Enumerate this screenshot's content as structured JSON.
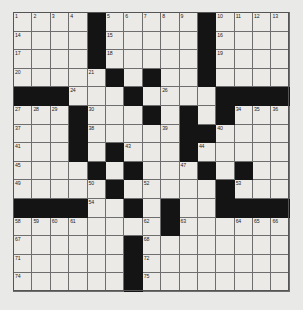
{
  "puzzle": {
    "kind": "crossword-grid",
    "rows": 15,
    "cols": 15,
    "colors": {
      "background": "#e9e9e7",
      "cell_fill": "#eceae6",
      "block_fill": "#141414",
      "grid_line": "#6e6e6e",
      "number_color": "#1d1d1d"
    },
    "layout": [
      "....#.....#....",
      "....#.....#....",
      "....#.....#....",
      ".....#.#..#....",
      "###...#....####",
      "...#...#.#.#...",
      "...#.....##....",
      "...#.#...#.....",
      "....#.#...#.#..",
      ".....#.....#...",
      "####..#.#..####",
      "........#......",
      "......#........",
      "......#........",
      "......#........"
    ],
    "numbers": [
      {
        "r": 0,
        "c": 0,
        "n": "1"
      },
      {
        "r": 0,
        "c": 1,
        "n": "2"
      },
      {
        "r": 0,
        "c": 2,
        "n": "3"
      },
      {
        "r": 0,
        "c": 3,
        "n": "4"
      },
      {
        "r": 0,
        "c": 5,
        "n": "5"
      },
      {
        "r": 0,
        "c": 6,
        "n": "6"
      },
      {
        "r": 0,
        "c": 7,
        "n": "7"
      },
      {
        "r": 0,
        "c": 8,
        "n": "8"
      },
      {
        "r": 0,
        "c": 9,
        "n": "9"
      },
      {
        "r": 0,
        "c": 11,
        "n": "10"
      },
      {
        "r": 0,
        "c": 12,
        "n": "11"
      },
      {
        "r": 0,
        "c": 13,
        "n": "12"
      },
      {
        "r": 0,
        "c": 14,
        "n": "13"
      },
      {
        "r": 1,
        "c": 0,
        "n": "14"
      },
      {
        "r": 1,
        "c": 5,
        "n": "15"
      },
      {
        "r": 1,
        "c": 11,
        "n": "16"
      },
      {
        "r": 2,
        "c": 0,
        "n": "17"
      },
      {
        "r": 2,
        "c": 5,
        "n": "18"
      },
      {
        "r": 2,
        "c": 11,
        "n": "19"
      },
      {
        "r": 3,
        "c": 0,
        "n": "20"
      },
      {
        "r": 3,
        "c": 4,
        "n": "21"
      },
      {
        "r": 3,
        "c": 7,
        "n": "22"
      },
      {
        "r": 3,
        "c": 10,
        "n": "23"
      },
      {
        "r": 4,
        "c": 3,
        "n": "24"
      },
      {
        "r": 4,
        "c": 6,
        "n": "25"
      },
      {
        "r": 4,
        "c": 8,
        "n": "26"
      },
      {
        "r": 5,
        "c": 0,
        "n": "27"
      },
      {
        "r": 5,
        "c": 1,
        "n": "28"
      },
      {
        "r": 5,
        "c": 2,
        "n": "29"
      },
      {
        "r": 5,
        "c": 4,
        "n": "30"
      },
      {
        "r": 5,
        "c": 7,
        "n": "31"
      },
      {
        "r": 5,
        "c": 9,
        "n": "32"
      },
      {
        "r": 5,
        "c": 11,
        "n": "33"
      },
      {
        "r": 5,
        "c": 12,
        "n": "34"
      },
      {
        "r": 5,
        "c": 13,
        "n": "35"
      },
      {
        "r": 5,
        "c": 14,
        "n": "36"
      },
      {
        "r": 6,
        "c": 0,
        "n": "37"
      },
      {
        "r": 6,
        "c": 4,
        "n": "38"
      },
      {
        "r": 6,
        "c": 8,
        "n": "39"
      },
      {
        "r": 6,
        "c": 11,
        "n": "40"
      },
      {
        "r": 7,
        "c": 0,
        "n": "41"
      },
      {
        "r": 7,
        "c": 3,
        "n": "42"
      },
      {
        "r": 7,
        "c": 6,
        "n": "43"
      },
      {
        "r": 7,
        "c": 10,
        "n": "44"
      },
      {
        "r": 8,
        "c": 0,
        "n": "45"
      },
      {
        "r": 8,
        "c": 6,
        "n": "46"
      },
      {
        "r": 8,
        "c": 9,
        "n": "47"
      },
      {
        "r": 8,
        "c": 12,
        "n": "48"
      },
      {
        "r": 9,
        "c": 0,
        "n": "49"
      },
      {
        "r": 9,
        "c": 4,
        "n": "50"
      },
      {
        "r": 9,
        "c": 5,
        "n": "51"
      },
      {
        "r": 9,
        "c": 7,
        "n": "52"
      },
      {
        "r": 9,
        "c": 12,
        "n": "53"
      },
      {
        "r": 10,
        "c": 4,
        "n": "54"
      },
      {
        "r": 10,
        "c": 6,
        "n": "55"
      },
      {
        "r": 10,
        "c": 8,
        "n": "56"
      },
      {
        "r": 10,
        "c": 11,
        "n": "57"
      },
      {
        "r": 11,
        "c": 0,
        "n": "58"
      },
      {
        "r": 11,
        "c": 1,
        "n": "59"
      },
      {
        "r": 11,
        "c": 2,
        "n": "60"
      },
      {
        "r": 11,
        "c": 3,
        "n": "61"
      },
      {
        "r": 11,
        "c": 7,
        "n": "62"
      },
      {
        "r": 11,
        "c": 9,
        "n": "63"
      },
      {
        "r": 11,
        "c": 12,
        "n": "64"
      },
      {
        "r": 11,
        "c": 13,
        "n": "65"
      },
      {
        "r": 11,
        "c": 14,
        "n": "66"
      },
      {
        "r": 12,
        "c": 0,
        "n": "67"
      },
      {
        "r": 12,
        "c": 7,
        "n": "68"
      },
      {
        "r": 13,
        "c": 0,
        "n": "71"
      },
      {
        "r": 13,
        "c": 7,
        "n": "72"
      },
      {
        "r": 14,
        "c": 0,
        "n": "74"
      },
      {
        "r": 14,
        "c": 7,
        "n": "75"
      }
    ]
  }
}
